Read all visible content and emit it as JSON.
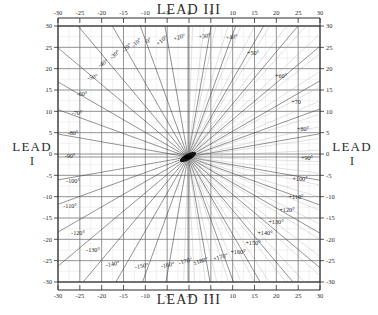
{
  "figure": {
    "title_top": "LEAD III",
    "title_bottom": "LEAD III",
    "label_left_main": "LEAD",
    "label_left_sub": "I",
    "label_right_main": "LEAD",
    "label_right_sub": "I"
  },
  "chart_data": {
    "type": "scatter",
    "title": "LEAD III",
    "xlabel": "LEAD III",
    "ylabel": "LEAD I",
    "grid": true,
    "legend_position": "none",
    "xlim": [
      -30,
      30
    ],
    "ylim": [
      -30,
      30
    ],
    "x_ticks_top": [
      "-30",
      "-25",
      "-20",
      "-15",
      "-10",
      "-5",
      "0",
      "5",
      "10",
      "15",
      "20",
      "25",
      "30"
    ],
    "x_ticks_bottom": [
      "-30",
      "-25",
      "-20",
      "-15",
      "-10",
      "-5",
      "-0",
      "5",
      "10",
      "15",
      "20",
      "25",
      "30"
    ],
    "y_ticks_left": [
      "30",
      "25",
      "20",
      "15",
      "10",
      "5",
      "0",
      "-5",
      "-10",
      "-15",
      "-20",
      "-25",
      "-30"
    ],
    "y_ticks_right": [
      "30",
      "25",
      "20",
      "15",
      "10",
      "5",
      "0",
      "-5",
      "-10",
      "-15",
      "-20",
      "-25",
      "-30"
    ],
    "tick_values": [
      -30,
      -25,
      -20,
      -15,
      -10,
      -5,
      0,
      5,
      10,
      15,
      20,
      25,
      30
    ],
    "minor_step": 5,
    "origin": {
      "x": 188,
      "y": 157
    },
    "radial_step_deg": 10,
    "axis_rays": [
      {
        "label": "0°",
        "deg": 0,
        "lx": 150,
        "ly": 42,
        "anchor": "middle",
        "rot": -40
      },
      {
        "label": "+10°",
        "deg": 10,
        "lx": 163,
        "ly": 42,
        "anchor": "middle",
        "rot": -40
      },
      {
        "label": "+20°",
        "deg": 20,
        "lx": 180,
        "ly": 39,
        "anchor": "middle",
        "rot": -18
      },
      {
        "label": "+30°",
        "deg": 30,
        "lx": 205,
        "ly": 38,
        "anchor": "middle",
        "rot": -10
      },
      {
        "label": "+40°",
        "deg": 40,
        "lx": 232,
        "ly": 39,
        "anchor": "middle",
        "rot": -10
      },
      {
        "label": "+50°",
        "deg": 50,
        "lx": 253,
        "ly": 55,
        "anchor": "middle",
        "rot": 0
      },
      {
        "label": "+60°",
        "deg": 60,
        "lx": 281,
        "ly": 78,
        "anchor": "middle",
        "rot": 0
      },
      {
        "label": "+70",
        "deg": 70,
        "lx": 296,
        "ly": 104,
        "anchor": "middle",
        "rot": 0
      },
      {
        "label": "+80°",
        "deg": 80,
        "lx": 303,
        "ly": 131,
        "anchor": "middle",
        "rot": 0
      },
      {
        "label": "+90°",
        "deg": 90,
        "lx": 307,
        "ly": 160,
        "anchor": "middle",
        "rot": 0
      },
      {
        "label": "+100°",
        "deg": 100,
        "lx": 300,
        "ly": 181,
        "anchor": "middle",
        "rot": 0
      },
      {
        "label": "+110°",
        "deg": 110,
        "lx": 296,
        "ly": 199,
        "anchor": "middle",
        "rot": 0
      },
      {
        "label": "+120°",
        "deg": 120,
        "lx": 287,
        "ly": 212,
        "anchor": "middle",
        "rot": 0
      },
      {
        "label": "+130°",
        "deg": 130,
        "lx": 276,
        "ly": 224,
        "anchor": "middle",
        "rot": 0
      },
      {
        "label": "+140°",
        "deg": 140,
        "lx": 265,
        "ly": 235,
        "anchor": "middle",
        "rot": 0
      },
      {
        "label": "+150°",
        "deg": 150,
        "lx": 253,
        "ly": 245,
        "anchor": "middle",
        "rot": 0
      },
      {
        "label": "+160°",
        "deg": 160,
        "lx": 238,
        "ly": 254,
        "anchor": "middle",
        "rot": 0
      },
      {
        "label": "+170°",
        "deg": 170,
        "lx": 221,
        "ly": 259,
        "anchor": "middle",
        "rot": -16
      },
      {
        "label": "±180°",
        "deg": 180,
        "lx": 201,
        "ly": 263,
        "anchor": "middle",
        "rot": -16
      },
      {
        "label": "-170°",
        "deg": -170,
        "lx": 186,
        "ly": 263,
        "anchor": "middle",
        "rot": -16
      },
      {
        "label": "-160°",
        "deg": -160,
        "lx": 168,
        "ly": 267,
        "anchor": "middle",
        "rot": -10
      },
      {
        "label": "-150°",
        "deg": -150,
        "lx": 142,
        "ly": 268,
        "anchor": "middle",
        "rot": -10
      },
      {
        "label": "-140°",
        "deg": -140,
        "lx": 113,
        "ly": 266,
        "anchor": "middle",
        "rot": -10
      },
      {
        "label": "-130°",
        "deg": -130,
        "lx": 93,
        "ly": 252,
        "anchor": "middle",
        "rot": 0
      },
      {
        "label": "-120°",
        "deg": -120,
        "lx": 78,
        "ly": 235,
        "anchor": "middle",
        "rot": 0
      },
      {
        "label": "-110°",
        "deg": -110,
        "lx": 70,
        "ly": 208,
        "anchor": "middle",
        "rot": 0
      },
      {
        "label": "-100°",
        "deg": -100,
        "lx": 73,
        "ly": 183,
        "anchor": "middle",
        "rot": 0
      },
      {
        "label": "-90°",
        "deg": -90,
        "lx": 70,
        "ly": 158,
        "anchor": "middle",
        "rot": 0
      },
      {
        "label": "-80°",
        "deg": -80,
        "lx": 73,
        "ly": 135,
        "anchor": "middle",
        "rot": 0
      },
      {
        "label": "-70°",
        "deg": -70,
        "lx": 77,
        "ly": 115,
        "anchor": "middle",
        "rot": 0
      },
      {
        "label": "-60°",
        "deg": -60,
        "lx": 82,
        "ly": 96,
        "anchor": "middle",
        "rot": 0
      },
      {
        "label": "-50°",
        "deg": -50,
        "lx": 93,
        "ly": 79,
        "anchor": "middle",
        "rot": -12
      },
      {
        "label": "-40°",
        "deg": -40,
        "lx": 104,
        "ly": 65,
        "anchor": "middle",
        "rot": -30
      },
      {
        "label": "-30°",
        "deg": -30,
        "lx": 116,
        "ly": 56,
        "anchor": "middle",
        "rot": -40
      },
      {
        "label": "-20°",
        "deg": -20,
        "lx": 128,
        "ly": 49,
        "anchor": "middle",
        "rot": -44
      },
      {
        "label": "-10°",
        "deg": -10,
        "lx": 138,
        "ly": 44,
        "anchor": "middle",
        "rot": -44
      }
    ],
    "colors": {
      "ink": "#2b2b2b",
      "grid": "#6e6e6e",
      "ray": "#3a3a3a",
      "paper": "#ffffff"
    }
  }
}
